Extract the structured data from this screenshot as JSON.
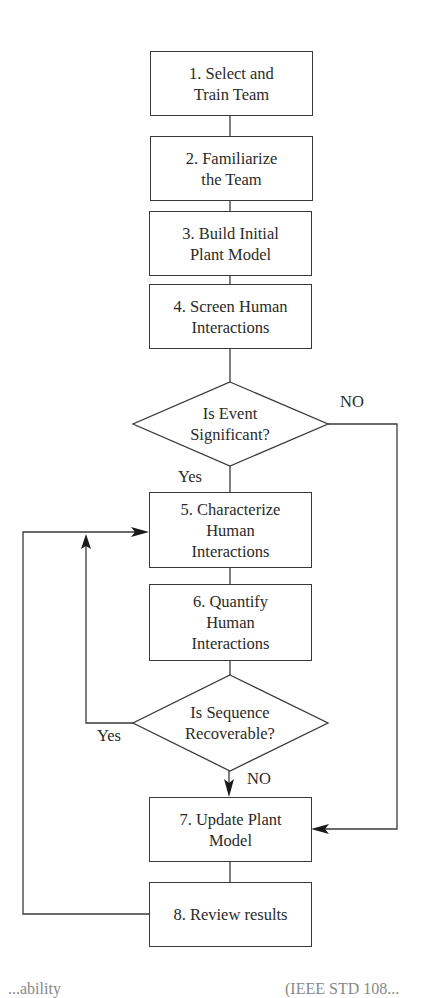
{
  "diagram": {
    "type": "flowchart",
    "steps": [
      {
        "id": 1,
        "lines": [
          "1. Select and",
          "Train Team"
        ]
      },
      {
        "id": 2,
        "lines": [
          "2. Familiarize",
          "the Team"
        ]
      },
      {
        "id": 3,
        "lines": [
          "3. Build Initial",
          "Plant Model"
        ]
      },
      {
        "id": 4,
        "lines": [
          "4. Screen Human",
          "Interactions"
        ]
      },
      {
        "id": 5,
        "lines": [
          "5. Characterize",
          "Human",
          "Interactions"
        ]
      },
      {
        "id": 6,
        "lines": [
          "6. Quantify",
          "Human",
          "Interactions"
        ]
      },
      {
        "id": 7,
        "lines": [
          "7. Update Plant",
          "Model"
        ]
      },
      {
        "id": 8,
        "lines": [
          "8. Review results"
        ]
      }
    ],
    "decisions": [
      {
        "id": "event-significant",
        "lines": [
          "Is Event",
          "Significant?"
        ],
        "yes_label": "Yes",
        "no_label": "NO"
      },
      {
        "id": "sequence-recoverable",
        "lines": [
          "Is Sequence",
          "Recoverable?"
        ],
        "yes_label": "Yes",
        "no_label": "NO"
      }
    ],
    "connections": [
      {
        "from": "step-1",
        "to": "step-2"
      },
      {
        "from": "step-2",
        "to": "step-3"
      },
      {
        "from": "step-3",
        "to": "step-4"
      },
      {
        "from": "step-4",
        "to": "event-significant"
      },
      {
        "from": "event-significant",
        "to": "step-5",
        "label": "Yes"
      },
      {
        "from": "event-significant",
        "to": "step-7",
        "label": "NO"
      },
      {
        "from": "step-5",
        "to": "step-6"
      },
      {
        "from": "step-6",
        "to": "sequence-recoverable"
      },
      {
        "from": "sequence-recoverable",
        "to": "step-5",
        "label": "Yes"
      },
      {
        "from": "sequence-recoverable",
        "to": "step-7",
        "label": "NO"
      },
      {
        "from": "step-7",
        "to": "step-8"
      },
      {
        "from": "step-8",
        "to": "step-5"
      }
    ],
    "colors": {
      "stroke": "#3a3a3a",
      "text": "#2a2a2a",
      "background": "#ffffff"
    }
  },
  "footer_clipped": {
    "left": "...ability",
    "right": "(IEEE STD 108..."
  }
}
